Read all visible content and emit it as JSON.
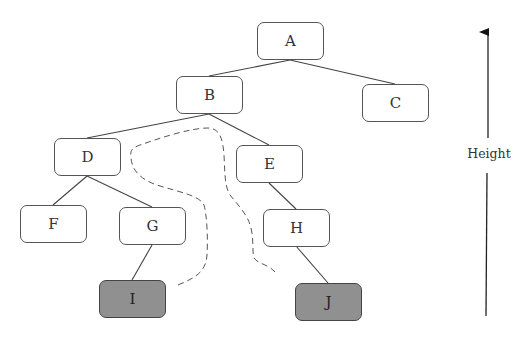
{
  "diagram": {
    "type": "tree",
    "nodes": [
      {
        "id": "A",
        "label": "A",
        "shaded": false,
        "x": 257,
        "y": 22
      },
      {
        "id": "B",
        "label": "B",
        "shaded": false,
        "x": 176,
        "y": 76
      },
      {
        "id": "C",
        "label": "C",
        "shaded": false,
        "x": 362,
        "y": 84
      },
      {
        "id": "D",
        "label": "D",
        "shaded": false,
        "x": 54,
        "y": 138
      },
      {
        "id": "E",
        "label": "E",
        "shaded": false,
        "x": 236,
        "y": 145
      },
      {
        "id": "F",
        "label": "F",
        "shaded": false,
        "x": 20,
        "y": 205
      },
      {
        "id": "G",
        "label": "G",
        "shaded": false,
        "x": 119,
        "y": 207
      },
      {
        "id": "H",
        "label": "H",
        "shaded": false,
        "x": 263,
        "y": 209
      },
      {
        "id": "I",
        "label": "I",
        "shaded": true,
        "x": 99,
        "y": 280
      },
      {
        "id": "J",
        "label": "J",
        "shaded": true,
        "x": 295,
        "y": 283
      }
    ],
    "edges": [
      [
        "A",
        "B"
      ],
      [
        "A",
        "C"
      ],
      [
        "B",
        "D"
      ],
      [
        "B",
        "E"
      ],
      [
        "D",
        "F"
      ],
      [
        "D",
        "G"
      ],
      [
        "G",
        "I"
      ],
      [
        "E",
        "H"
      ],
      [
        "H",
        "J"
      ]
    ],
    "dashed_path": "connects I and J through common ancestor B",
    "axis_label": "Height",
    "colors": {
      "node_fill": "#ffffff",
      "shaded_fill": "#909090",
      "stroke": "#555555"
    }
  }
}
